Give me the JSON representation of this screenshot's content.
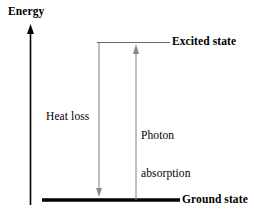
{
  "diagram": {
    "type": "energy-level-diagram",
    "title_axis": "Energy",
    "background_color": "#ffffff",
    "line_color": "#000000",
    "thin_line_color": "#5a5a5a",
    "axis": {
      "label": "Energy",
      "orientation": "vertical",
      "arrow_direction": "up"
    },
    "levels": [
      {
        "id": "excited",
        "label": "Excited state",
        "style": "thin",
        "y": 42
      },
      {
        "id": "ground",
        "label": "Ground state",
        "style": "thick",
        "y": 200
      }
    ],
    "transitions": [
      {
        "id": "heat-loss",
        "label": "Heat loss",
        "direction": "down",
        "from_level": "excited",
        "to_level": "ground"
      },
      {
        "id": "photon-absorption",
        "label_line1": "Photon",
        "label_line2": "absorption",
        "label": "Photon absorption",
        "direction": "up",
        "from_level": "ground",
        "to_level": "excited"
      }
    ]
  }
}
